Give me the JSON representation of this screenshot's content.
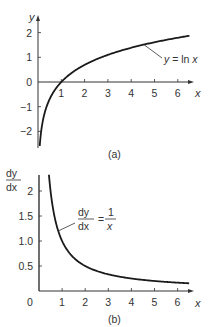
{
  "chart_data": [
    {
      "type": "line",
      "id": "a",
      "caption": "(a)",
      "xlabel": "x",
      "ylabel": "y",
      "xlim": [
        0,
        6.7
      ],
      "ylim": [
        -2.6,
        2.4
      ],
      "x_ticks": [
        1,
        2,
        3,
        4,
        5,
        6
      ],
      "x_tick_labels": [
        "1",
        "2",
        "3",
        "4",
        "5",
        "6"
      ],
      "y_ticks": [
        2,
        1,
        0,
        -1,
        -2
      ],
      "y_tick_labels": [
        "2",
        "1",
        "0",
        "−1",
        "−2"
      ],
      "grid": false,
      "series": [
        {
          "name": "y = ln x",
          "function": "ln(x)",
          "x": [
            0.075,
            0.1,
            0.15,
            0.2,
            0.3,
            0.4,
            0.5,
            0.7,
            1,
            1.5,
            2,
            2.5,
            3,
            3.5,
            4,
            4.5,
            5,
            5.5,
            6,
            6.5
          ],
          "values": [
            -2.59,
            -2.3,
            -1.9,
            -1.61,
            -1.2,
            -0.92,
            -0.69,
            -0.36,
            0,
            0.41,
            0.69,
            0.92,
            1.1,
            1.25,
            1.39,
            1.5,
            1.61,
            1.7,
            1.79,
            1.87
          ]
        }
      ],
      "annotation": {
        "lhs": "y",
        "eq": " = ",
        "rhs_fn": "ln ",
        "rhs_var": "x",
        "anchor_x": 4.55,
        "anchor_y": 1.51
      }
    },
    {
      "type": "line",
      "id": "b",
      "caption": "(b)",
      "xlabel": "x",
      "ylabel_num": "dy",
      "ylabel_den": "dx",
      "xlim": [
        0,
        6.7
      ],
      "ylim": [
        0,
        2.35
      ],
      "x_ticks": [
        1,
        2,
        3,
        4,
        5,
        6
      ],
      "x_tick_labels": [
        "1",
        "2",
        "3",
        "4",
        "5",
        "6"
      ],
      "origin_label": "0",
      "y_ticks": [
        2,
        1.5,
        1.0,
        0.5
      ],
      "y_tick_labels": [
        "2",
        "1.5",
        "1.0",
        "0.5"
      ],
      "grid": false,
      "series": [
        {
          "name": "dy/dx = 1/x",
          "function": "1/x",
          "x": [
            0.43,
            0.5,
            0.6,
            0.7,
            0.8,
            1,
            1.25,
            1.5,
            2,
            2.5,
            3,
            3.5,
            4,
            4.5,
            5,
            5.5,
            6,
            6.5
          ],
          "values": [
            2.33,
            2.0,
            1.67,
            1.43,
            1.25,
            1.0,
            0.8,
            0.67,
            0.5,
            0.4,
            0.33,
            0.29,
            0.25,
            0.22,
            0.2,
            0.18,
            0.17,
            0.15
          ]
        }
      ],
      "annotation": {
        "lhs_num": "dy",
        "lhs_den": "dx",
        "eq": "=",
        "rhs_num": "1",
        "rhs_den": "x",
        "anchor_x": 0.83,
        "anchor_y": 1.2
      }
    }
  ],
  "colors": {
    "curve": "#1a1a1a",
    "axis": "#333333",
    "text": "#333333",
    "background": "#ffffff"
  }
}
